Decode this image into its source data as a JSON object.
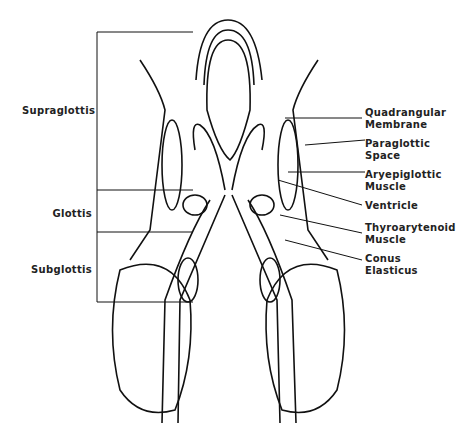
{
  "diagram": {
    "regions": [
      {
        "label": "Supraglottis"
      },
      {
        "label": "Glottis"
      },
      {
        "label": "Subglottis"
      }
    ],
    "structures": [
      {
        "line1": "Quadrangular",
        "line2": "Membrane"
      },
      {
        "line1": "Paraglottic",
        "line2": "Space"
      },
      {
        "line1": "Aryepiglottic",
        "line2": "Muscle"
      },
      {
        "line1": "Ventricle",
        "line2": ""
      },
      {
        "line1": "Thyroarytenoid",
        "line2": "Muscle"
      },
      {
        "line1": "Conus",
        "line2": "Elasticus"
      }
    ]
  }
}
